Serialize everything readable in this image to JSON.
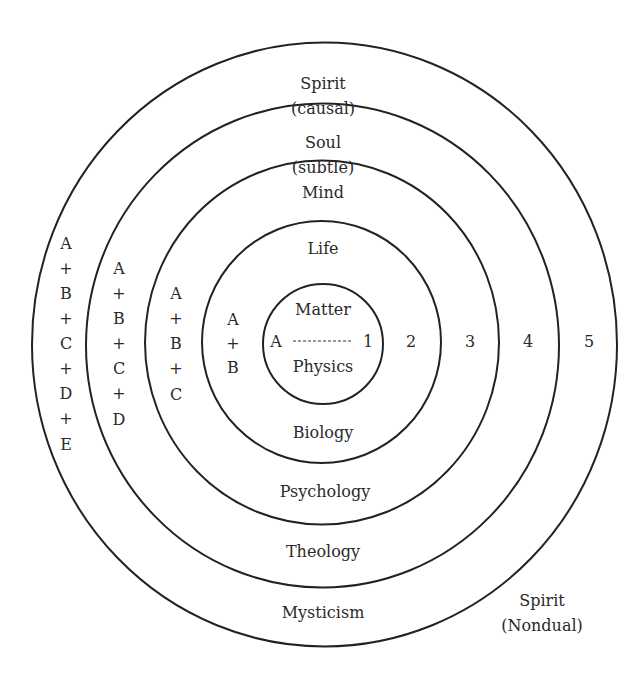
{
  "diagram": {
    "rings": [
      {
        "id": "matter",
        "cx": 323,
        "cy": 344,
        "rx": 60,
        "ry": 60
      },
      {
        "id": "life",
        "cx": 321.5,
        "cy": 342,
        "rx": 119.5,
        "ry": 121
      },
      {
        "id": "mind",
        "cx": 322,
        "cy": 342.5,
        "rx": 177,
        "ry": 182
      },
      {
        "id": "soul",
        "cx": 322.5,
        "cy": 345.5,
        "rx": 236.5,
        "ry": 242
      },
      {
        "id": "spirit",
        "cx": 324.5,
        "cy": 344.5,
        "rx": 292.5,
        "ry": 302
      }
    ],
    "levels": {
      "spirit_causal": {
        "line1": "Spirit",
        "line2": "(causal)"
      },
      "soul_subtle": {
        "line1": "Soul",
        "line2": "(subtle)"
      },
      "mind": "Mind",
      "life": "Life",
      "matter": "Matter"
    },
    "sciences": {
      "physics": "Physics",
      "biology": "Biology",
      "psychology": "Psychology",
      "theology": "Theology",
      "mysticism": "Mysticism"
    },
    "nondual": {
      "line1": "Spirit",
      "line2": "(Nondual)"
    },
    "axis": {
      "start": "A",
      "numbers": [
        "1",
        "2",
        "3",
        "4",
        "5"
      ]
    },
    "stacks": {
      "ring2": [
        "A",
        "+",
        "B"
      ],
      "ring3": [
        "A",
        "+",
        "B",
        "+",
        "C"
      ],
      "ring4": [
        "A",
        "+",
        "B",
        "+",
        "C",
        "+",
        "D"
      ],
      "ring5": [
        "A",
        "+",
        "B",
        "+",
        "C",
        "+",
        "D",
        "+",
        "E"
      ]
    }
  }
}
